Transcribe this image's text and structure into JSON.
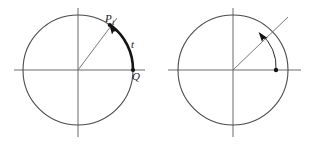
{
  "figure": {
    "title": "",
    "background_color": "#ffffff",
    "stroke_color": "#55555a",
    "bold_stroke_color": "#111111",
    "panels": [
      {
        "id": "left-panel",
        "name": "unit-circle-with-arc-length-t",
        "center": {
          "x": 78,
          "y": 70
        },
        "radius": 55,
        "axes": {
          "x_axis": {
            "x1": 14,
            "y1": 70,
            "x2": 145,
            "y2": 70
          },
          "y_axis": {
            "x1": 78,
            "y1": 8,
            "x2": 78,
            "y2": 137
          }
        },
        "terminal_angle_deg": 55,
        "labels": [
          {
            "name": "point-P-t-label",
            "text": "P",
            "subscript": "t",
            "x": 106,
            "y": 21
          },
          {
            "name": "arc-length-t-label",
            "text": "t",
            "x": 133,
            "y": 47
          },
          {
            "name": "point-Q-label",
            "text": "Q",
            "x": 134,
            "y": 79
          }
        ],
        "markers": [
          {
            "name": "point-P-t-marker",
            "x": 109,
            "y": 25
          },
          {
            "name": "point-Q-marker",
            "x": 133,
            "y": 70
          }
        ],
        "arc": {
          "name": "bold-arc-from-Q-to-P-t",
          "from_deg": 0,
          "to_deg": 55,
          "bold": true,
          "arrow_at": "P_t"
        }
      },
      {
        "id": "right-panel",
        "name": "unit-circle-with-rotation-arrow",
        "center": {
          "x": 233,
          "y": 70
        },
        "radius": 55,
        "axes": {
          "x_axis": {
            "x1": 168,
            "y1": 70,
            "x2": 300,
            "y2": 70
          },
          "y_axis": {
            "x1": 233,
            "y1": 8,
            "x2": 233,
            "y2": 137
          }
        },
        "terminal_angle_deg": 55,
        "labels": [],
        "markers": [
          {
            "name": "interior-point-marker",
            "x": 276,
            "y": 70
          }
        ],
        "arc": {
          "name": "thin-rotation-arc",
          "from_deg": 0,
          "to_deg": 62,
          "bold": false,
          "arrow_at": "terminal-side"
        }
      }
    ]
  }
}
